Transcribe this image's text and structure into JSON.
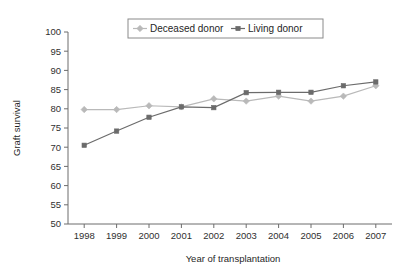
{
  "chart_data": {
    "type": "line",
    "title": "",
    "xlabel": "Year of transplantation",
    "ylabel": "Graft survival",
    "x": [
      1998,
      1999,
      2000,
      2001,
      2002,
      2003,
      2004,
      2005,
      2006,
      2007
    ],
    "categories": [
      "1998",
      "1999",
      "2000",
      "2001",
      "2002",
      "2003",
      "2004",
      "2005",
      "2006",
      "2007"
    ],
    "series": [
      {
        "name": "Deceased donor",
        "marker": "diamond",
        "color": "#b9b9b9",
        "values": [
          79.8,
          79.8,
          80.8,
          80.5,
          82.6,
          82.0,
          83.3,
          82.0,
          83.3,
          86.0
        ]
      },
      {
        "name": "Living donor",
        "marker": "square",
        "color": "#6b6b6b",
        "values": [
          70.5,
          74.2,
          77.8,
          80.5,
          80.3,
          84.2,
          84.3,
          84.3,
          86.0,
          87.0
        ]
      }
    ],
    "ylim": [
      50,
      100
    ],
    "yticks": [
      50,
      55,
      60,
      65,
      70,
      75,
      80,
      85,
      90,
      95,
      100
    ],
    "ytick_labels": [
      "50",
      "55",
      "60",
      "65",
      "70",
      "75",
      "80",
      "85",
      "90",
      "95",
      "100"
    ],
    "xlim": [
      1997.5,
      2007.5
    ],
    "grid": false,
    "legend_position": "top-center",
    "legend_entries": [
      "Deceased donor",
      "Living donor"
    ]
  },
  "axes": {
    "y_title": "Graft survival",
    "x_title": "Year of transplantation"
  },
  "legend": {
    "entry_0_label": "Deceased donor",
    "entry_1_label": "Living donor"
  },
  "colors": {
    "deceased": "#b9b9b9",
    "living": "#6b6b6b",
    "axis": "#6d6d6d",
    "text": "#1f1f1f",
    "background": "#ffffff"
  }
}
